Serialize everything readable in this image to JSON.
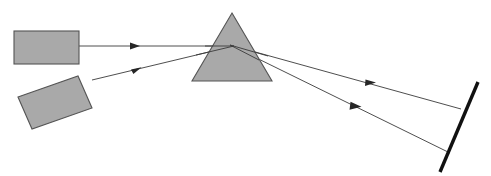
{
  "figure": {
    "canvas": {
      "width": 491,
      "height": 176
    },
    "background_color": "#ffffff"
  },
  "colors": {
    "shape_fill": "#a9a9a9",
    "shape_stroke": "#545454",
    "ray_stroke": "#3a3a3a",
    "arrow_fill": "#262626",
    "screen_stroke": "#111111"
  },
  "objects": {
    "source_block_upper": {
      "label": "upper source block",
      "shape": "rectangle",
      "x": 14,
      "y": 31,
      "width": 65,
      "height": 33,
      "rotation_deg": 0
    },
    "source_block_lower": {
      "label": "lower tilted source block",
      "shape": "rectangle",
      "points": "18,97 78,76 92,108 32,129",
      "rotation_deg": -19
    },
    "prism": {
      "label": "triangular prism",
      "shape": "triangle",
      "points": "232,13 272,81 192,81",
      "apex_x": 232,
      "apex_y": 13,
      "base_left_x": 192,
      "base_right_x": 272,
      "base_y": 81
    },
    "screen": {
      "label": "detection screen",
      "shape": "thick line",
      "x1": 478,
      "y1": 82,
      "x2": 440,
      "y2": 172,
      "thickness": 3.4
    }
  },
  "rays": [
    {
      "name": "incident-ray-upper",
      "description": "horizontal ray from upper block to prism",
      "path": "79,46 232,46",
      "arrow": {
        "x": 136,
        "y": 46,
        "angle_deg": 0
      }
    },
    {
      "name": "incident-ray-lower",
      "description": "angled ray from lower tilted block to prism",
      "path": "92,80 232,46",
      "arrow": {
        "x": 137,
        "y": 69,
        "angle_deg": -13.6
      }
    },
    {
      "name": "refracted-ray-upper",
      "description": "upper refracted ray exiting prism toward screen",
      "path": "232,46 460,109",
      "arrow": {
        "x": 371,
        "y": 84,
        "angle_deg": 15.5
      }
    },
    {
      "name": "refracted-ray-lower",
      "description": "lower refracted ray exiting prism toward screen",
      "path": "232,46 449,152",
      "arrow": {
        "x": 357,
        "y": 107,
        "angle_deg": 26.0
      }
    }
  ]
}
